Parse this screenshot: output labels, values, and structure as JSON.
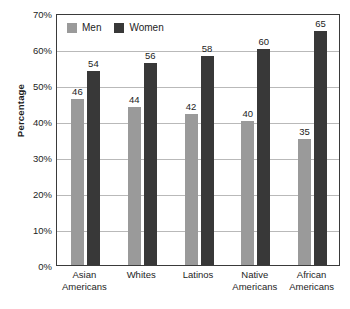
{
  "chart_data": {
    "type": "bar",
    "title": "",
    "subtitle": "",
    "xlabel": "",
    "ylabel": "Percentage",
    "ylim": [
      0,
      70
    ],
    "ytick_labels": [
      "0%",
      "10%",
      "20%",
      "30%",
      "40%",
      "50%",
      "60%",
      "70%"
    ],
    "ytick_values": [
      0,
      10,
      20,
      30,
      40,
      50,
      60,
      70
    ],
    "grid": true,
    "legend_position": "top-left",
    "categories": [
      "Asian Americans",
      "Whites",
      "Latinos",
      "Native Americans",
      "African Americans"
    ],
    "category_lines": [
      [
        "Asian",
        "Americans"
      ],
      [
        "Whites"
      ],
      [
        "Latinos"
      ],
      [
        "Native",
        "Americans"
      ],
      [
        "African",
        "Americans"
      ]
    ],
    "series": [
      {
        "name": "Men",
        "color": "#9a9a9a",
        "values": [
          46,
          44,
          42,
          40,
          35
        ],
        "labels": [
          "46",
          "44",
          "42",
          "40",
          "35"
        ]
      },
      {
        "name": "Women",
        "color": "#383838",
        "values": [
          54,
          56,
          58,
          60,
          65
        ],
        "labels": [
          "54",
          "56",
          "58",
          "60",
          "65"
        ]
      }
    ]
  },
  "legend": {
    "entries": [
      {
        "label": "Men",
        "color": "#9a9a9a"
      },
      {
        "label": "Women",
        "color": "#383838"
      }
    ]
  },
  "colors": {
    "men": "#9a9a9a",
    "women": "#383838",
    "gridline": "#b9b9b9",
    "axis": "#3a3a3a",
    "text": "#1d1d1d",
    "background": "#ffffff"
  }
}
